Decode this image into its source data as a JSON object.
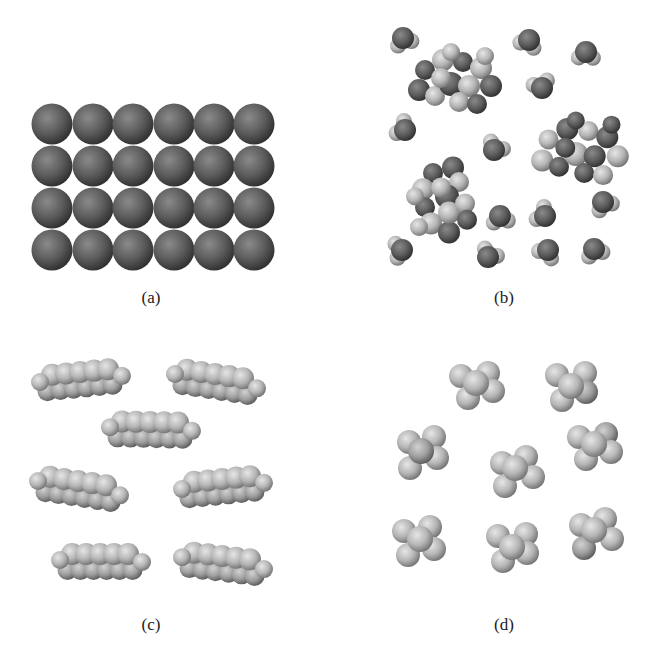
{
  "figure": {
    "panels": [
      {
        "id": "a",
        "label": "(a)",
        "label_pos": [
          151,
          288
        ],
        "description": "close-packed atoms of a metallic solid (6x4 grid)"
      },
      {
        "id": "b",
        "label": "(b)",
        "label_pos": [
          504,
          288
        ],
        "description": "water molecules with hydrogen-bonded clusters"
      },
      {
        "id": "c",
        "label": "(c)",
        "label_pos": [
          151,
          615
        ],
        "description": "elongated hydrocarbon molecules"
      },
      {
        "id": "d",
        "label": "(d)",
        "label_pos": [
          504,
          615
        ],
        "description": "small compact molecules"
      }
    ],
    "colors": {
      "dark_atom": "#555555",
      "light_atom": "#bdbdbd",
      "background": "#ffffff"
    }
  }
}
